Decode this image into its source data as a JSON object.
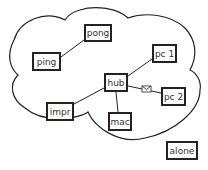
{
  "diagram": {
    "type": "network",
    "cloud": {
      "label": ""
    },
    "nodes": [
      {
        "id": "pong",
        "label": "pong",
        "x": 84,
        "y": 24,
        "w": 28,
        "h": 18
      },
      {
        "id": "ping",
        "label": "ping",
        "x": 32,
        "y": 52,
        "w": 29,
        "h": 19
      },
      {
        "id": "pc1",
        "label": "pc 1",
        "x": 152,
        "y": 44,
        "w": 25,
        "h": 19
      },
      {
        "id": "hub",
        "label": "hub",
        "x": 104,
        "y": 73,
        "w": 24,
        "h": 19
      },
      {
        "id": "pc2",
        "label": "pc 2",
        "x": 161,
        "y": 87,
        "w": 25,
        "h": 19
      },
      {
        "id": "impr",
        "label": "impr",
        "x": 46,
        "y": 102,
        "w": 28,
        "h": 19
      },
      {
        "id": "mac",
        "label": "mac",
        "x": 108,
        "y": 112,
        "w": 24,
        "h": 19
      },
      {
        "id": "alone",
        "label": "alone",
        "x": 166,
        "y": 141,
        "w": 32,
        "h": 19
      }
    ],
    "edges": [
      {
        "from": "ping",
        "to": "pong"
      },
      {
        "from": "hub",
        "to": "pc1"
      },
      {
        "from": "hub",
        "to": "pc2",
        "message": "envelope"
      },
      {
        "from": "hub",
        "to": "impr"
      },
      {
        "from": "hub",
        "to": "mac"
      }
    ]
  }
}
